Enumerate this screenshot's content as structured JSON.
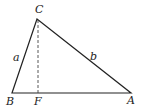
{
  "diagram": {
    "type": "triangle-with-altitude",
    "vertices": {
      "C": {
        "label": "C",
        "x": 37,
        "y": 19
      },
      "B": {
        "label": "B",
        "x": 12,
        "y": 93
      },
      "A": {
        "label": "A",
        "x": 131,
        "y": 93
      },
      "F": {
        "label": "F",
        "x": 38,
        "y": 93
      }
    },
    "sides": {
      "a": {
        "label": "a",
        "from": "B",
        "to": "C"
      },
      "b": {
        "label": "b",
        "from": "C",
        "to": "A"
      }
    },
    "altitude": {
      "from": "C",
      "to": "F",
      "style": "dashed"
    },
    "colors": {
      "stroke": "#222222",
      "background": "#ffffff"
    }
  }
}
